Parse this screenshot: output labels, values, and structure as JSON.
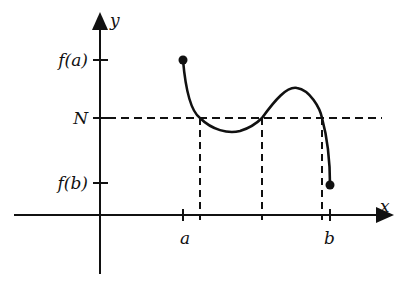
{
  "diagram": {
    "axes": {
      "x_label": "x",
      "y_label": "y"
    },
    "y_ticks": [
      {
        "label": "f(a)",
        "y": 60
      },
      {
        "label": "N",
        "y": 118
      },
      {
        "label": "f(b)",
        "y": 183
      }
    ],
    "x_ticks": [
      {
        "label": "a",
        "x": 183
      },
      {
        "label": "b",
        "x": 330
      }
    ],
    "curve": {
      "start_point": {
        "x": 183,
        "y": 60
      },
      "end_point": {
        "x": 330,
        "y": 185
      },
      "crossings_with_N": [
        200,
        262,
        322
      ]
    },
    "colors": {
      "line": "#111111",
      "background": "#ffffff"
    }
  }
}
